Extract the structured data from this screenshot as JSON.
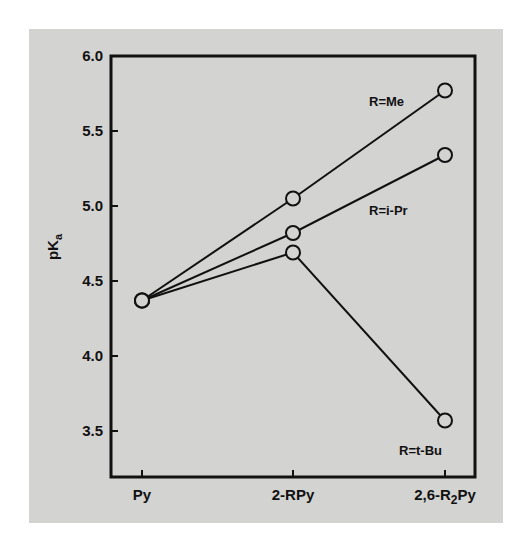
{
  "chart_data": {
    "type": "line",
    "title": "",
    "xlabel": "",
    "ylabel": "pKa",
    "ylabel_main": "pK",
    "ylabel_sub": "a",
    "categories": [
      "Py",
      "2-RPy",
      "2,6-R2Py"
    ],
    "category_labels": [
      {
        "main": "Py",
        "sub": "",
        "tail": ""
      },
      {
        "main": "2-RPy",
        "sub": "",
        "tail": ""
      },
      {
        "main": "2,6-R",
        "sub": "2",
        "tail": "Py"
      }
    ],
    "yticks": [
      3.5,
      4.0,
      4.5,
      5.0,
      5.5,
      6.0
    ],
    "ytick_labels": [
      "3.5",
      "4.0",
      "4.5",
      "5.0",
      "5.5",
      "6.0"
    ],
    "ylim": [
      3.2,
      6.0
    ],
    "grid": false,
    "legend": "inline labels near series ends",
    "series": [
      {
        "name": "R=Me",
        "values": [
          4.37,
          5.05,
          5.77
        ]
      },
      {
        "name": "R=i-Pr",
        "values": [
          4.37,
          4.82,
          5.34
        ]
      },
      {
        "name": "R=t-Bu",
        "values": [
          4.37,
          4.69,
          3.57
        ]
      }
    ],
    "marker": "open-circle",
    "colors": {
      "line": "#111111",
      "marker_fill": "#d3d3d1",
      "background": "#d3d3d1"
    }
  },
  "annotations": {
    "me": "R=Me",
    "ipr": "R=i-Pr",
    "tbu": "R=t-Bu"
  }
}
